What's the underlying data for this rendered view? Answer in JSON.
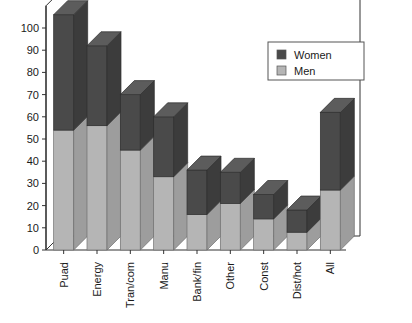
{
  "chart_data": {
    "type": "bar",
    "subtype": "stacked-3d-column",
    "title": "",
    "subtitle": "",
    "xlabel": "",
    "ylabel": "",
    "ylim": [
      0,
      110
    ],
    "yticks": [
      0,
      10,
      20,
      30,
      40,
      50,
      60,
      70,
      80,
      90,
      100
    ],
    "ytick_labels": [
      "0",
      "10",
      "20",
      "30",
      "40",
      "50",
      "60",
      "70",
      "80",
      "90",
      "100"
    ],
    "grid": false,
    "legend_position": "top-right",
    "categories": [
      "Puad",
      "Energy",
      "Tran/com",
      "Manu",
      "Bank/fin",
      "Other",
      "Const",
      "Dist/hot",
      "All"
    ],
    "series": [
      {
        "name": "Men",
        "color": "#b5b5b5",
        "values": [
          54,
          56,
          45,
          33,
          16,
          21,
          14,
          8,
          27
        ]
      },
      {
        "name": "Women",
        "color": "#4a4a4a",
        "values": [
          52,
          36,
          25,
          27,
          20,
          14,
          11,
          10,
          35
        ]
      }
    ],
    "totals": [
      106,
      92,
      70,
      60,
      36,
      35,
      25,
      18,
      62
    ],
    "legend": [
      {
        "label": "Women",
        "color": "#4a4a4a"
      },
      {
        "label": "Men",
        "color": "#b5b5b5"
      }
    ]
  },
  "colors": {
    "women": "#4a4a4a",
    "women_side": "#3c3c3c",
    "women_top": "#5c5c5c",
    "men": "#b5b5b5",
    "men_side": "#9d9d9d",
    "men_top": "#c9c9c9",
    "axis": "#333333",
    "floor": "#ffffff",
    "legend_border": "#555555",
    "background": "#ffffff"
  }
}
